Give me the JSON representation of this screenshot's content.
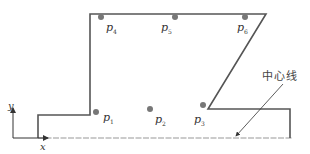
{
  "diagram": {
    "type": "profile-with-points",
    "colors": {
      "outline": "#555555",
      "point": "#777777",
      "centerline": "#bbbbbb",
      "text": "#333333"
    },
    "points": [
      {
        "id": "p1",
        "base": "p",
        "sub": "1"
      },
      {
        "id": "p2",
        "base": "p",
        "sub": "2"
      },
      {
        "id": "p3",
        "base": "p",
        "sub": "3"
      },
      {
        "id": "p4",
        "base": "p",
        "sub": "4"
      },
      {
        "id": "p5",
        "base": "p",
        "sub": "5"
      },
      {
        "id": "p6",
        "base": "p",
        "sub": "6"
      }
    ],
    "axes": {
      "x_label": "x",
      "y_label": "y"
    },
    "centerline_label": "中心线"
  }
}
